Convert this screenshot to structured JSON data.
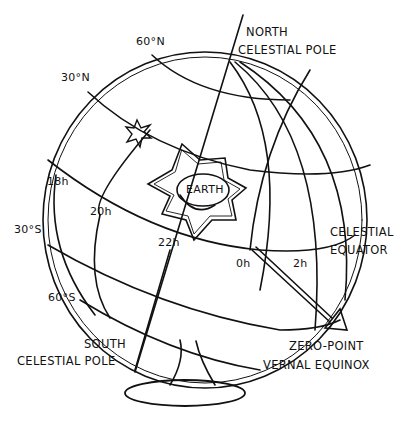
{
  "diagram": {
    "center": {
      "label": "EARTH"
    },
    "poles": {
      "north": {
        "line1": "NORTH",
        "line2": "CELESTIAL POLE"
      },
      "south": {
        "line1": "SOUTH",
        "line2": "CELESTIAL POLE"
      }
    },
    "declination_labels": [
      "60°N",
      "30°N",
      "30°S",
      "60°S"
    ],
    "right_ascension_labels": [
      "18h",
      "20h",
      "22h",
      "0h",
      "2h"
    ],
    "equator": {
      "line1": "CELESTIAL",
      "line2": "EQUATOR"
    },
    "vernal_equinox": {
      "line1": "ZERO-POINT",
      "line2": "VERNAL EQUINOX"
    },
    "colors": {
      "ink": "#111111",
      "background": "#ffffff"
    }
  }
}
